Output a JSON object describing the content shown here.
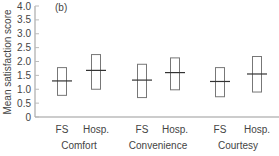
{
  "chart_data": {
    "type": "box",
    "panel_label": "(b)",
    "title": "",
    "xlabel": "",
    "ylabel": "Mean satisfaction score",
    "ylim": [
      0,
      4.0
    ],
    "yticks": [
      "0",
      "0.5",
      "1.0",
      "1.5",
      "2.0",
      "2.5",
      "3.0",
      "3.5",
      "4.0"
    ],
    "grid": false,
    "groups": [
      {
        "name": "Comfort",
        "items": [
          {
            "label": "FS",
            "low": 0.78,
            "high": 1.78,
            "mean": 1.3
          },
          {
            "label": "Hosp.",
            "low": 1.0,
            "high": 2.25,
            "mean": 1.68
          }
        ]
      },
      {
        "name": "Convenience",
        "items": [
          {
            "label": "FS",
            "low": 0.7,
            "high": 1.9,
            "mean": 1.33
          },
          {
            "label": "Hosp.",
            "low": 0.98,
            "high": 2.13,
            "mean": 1.6
          }
        ]
      },
      {
        "name": "Courtesy",
        "items": [
          {
            "label": "FS",
            "low": 0.73,
            "high": 1.78,
            "mean": 1.28
          },
          {
            "label": "Hosp.",
            "low": 0.9,
            "high": 2.18,
            "mean": 1.55
          }
        ]
      }
    ]
  }
}
